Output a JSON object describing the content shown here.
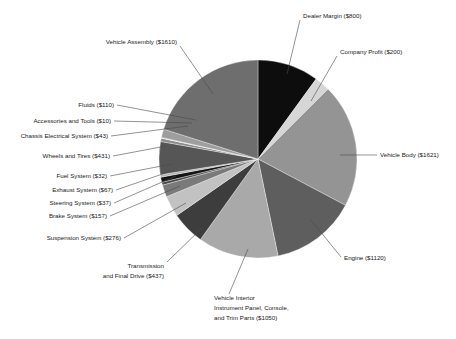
{
  "chart_data": {
    "type": "pie",
    "title": "",
    "subtitle": "",
    "xlabel": "",
    "ylabel": "",
    "legend_position": "callout-labels",
    "grid": false,
    "currency": "$",
    "total": 9111,
    "start_angle_deg": 0,
    "direction": "clockwise",
    "categories": [
      "Dealer Margin",
      "Company Profit",
      "Vehicle Body",
      "Engine",
      "Vehicle Interior Instrument Panel, Console, and Trim Parts",
      "Transmission and Final Drive",
      "Suspension System",
      "Brake System",
      "Steering System",
      "Exhaust System",
      "Fuel System",
      "Wheels and Tires",
      "Chassis Electrical System",
      "Accessories and Tools",
      "Fluids",
      "Vehicle Assembly"
    ],
    "values": [
      800,
      200,
      1621,
      1120,
      1050,
      437,
      276,
      157,
      37,
      67,
      32,
      431,
      43,
      10,
      110,
      1610
    ],
    "colors": [
      "#0d0d0d",
      "#d6d6d6",
      "#949494",
      "#5e5e5e",
      "#a9a9a9",
      "#3d3d3d",
      "#c2c2c2",
      "#7a7a7a",
      "#4a4a4a",
      "#141414",
      "#b5b5b5",
      "#565656",
      "#8c8c8c",
      "#e0e0e0",
      "#9e9e9e",
      "#6e6e6e"
    ],
    "slices": [
      {
        "label": "Dealer Margin ($800)",
        "name": "Dealer Margin",
        "value": 800,
        "color": "#0d0d0d"
      },
      {
        "label": "Company Profit ($200)",
        "name": "Company Profit",
        "value": 200,
        "color": "#d6d6d6"
      },
      {
        "label": "Vehicle Body ($1621)",
        "name": "Vehicle Body",
        "value": 1621,
        "color": "#949494"
      },
      {
        "label": "Engine ($1120)",
        "name": "Engine",
        "value": 1120,
        "color": "#5e5e5e"
      },
      {
        "label": "Vehicle Interior Instrument Panel, Console, and Trim Parts ($1050)",
        "name": "Vehicle Interior",
        "value": 1050,
        "color": "#a9a9a9"
      },
      {
        "label": "Transmission and Final Drive ($437)",
        "name": "Transmission and Final Drive",
        "value": 437,
        "color": "#3d3d3d"
      },
      {
        "label": "Suspension System ($276)",
        "name": "Suspension System",
        "value": 276,
        "color": "#c2c2c2"
      },
      {
        "label": "Brake System ($157)",
        "name": "Brake System",
        "value": 157,
        "color": "#7a7a7a"
      },
      {
        "label": "Steering System ($37)",
        "name": "Steering System",
        "value": 37,
        "color": "#4a4a4a"
      },
      {
        "label": "Exhaust System ($67)",
        "name": "Exhaust System",
        "value": 67,
        "color": "#141414"
      },
      {
        "label": "Fuel System ($32)",
        "name": "Fuel System",
        "value": 32,
        "color": "#b5b5b5"
      },
      {
        "label": "Wheels and Tires ($431)",
        "name": "Wheels and Tires",
        "value": 431,
        "color": "#565656"
      },
      {
        "label": "Chassis Electrical System ($43)",
        "name": "Chassis Electrical System",
        "value": 43,
        "color": "#8c8c8c"
      },
      {
        "label": "Accessories and Tools ($10)",
        "name": "Accessories and Tools",
        "value": 10,
        "color": "#e0e0e0"
      },
      {
        "label": "Fluids ($110)",
        "name": "Fluids",
        "value": 110,
        "color": "#9e9e9e"
      },
      {
        "label": "Vehicle Assembly ($1610)",
        "name": "Vehicle Assembly",
        "value": 1610,
        "color": "#6e6e6e"
      }
    ]
  },
  "labels": {
    "dealer_margin": "Dealer Margin ($800)",
    "company_profit": "Company Profit ($200)",
    "vehicle_body": "Vehicle Body ($1621)",
    "engine": "Engine ($1120)",
    "vehicle_interior_l1": "Vehicle Interior",
    "vehicle_interior_l2": "Instrument Panel, Console,",
    "vehicle_interior_l3": "and Trim Parts ($1050)",
    "transmission_l1": "Transmission",
    "transmission_l2": "and Final Drive ($437)",
    "suspension": "Suspension System ($276)",
    "brake": "Brake System ($157)",
    "steering": "Steering System ($37)",
    "exhaust": "Exhaust System ($67)",
    "fuel": "Fuel System ($32)",
    "wheels": "Wheels and Tires ($431)",
    "chassis": "Chassis Electrical System ($43)",
    "accessories": "Accessories and Tools ($10)",
    "fluids": "Fluids ($110)",
    "vehicle_assembly": "Vehicle Assembly ($1610)"
  }
}
